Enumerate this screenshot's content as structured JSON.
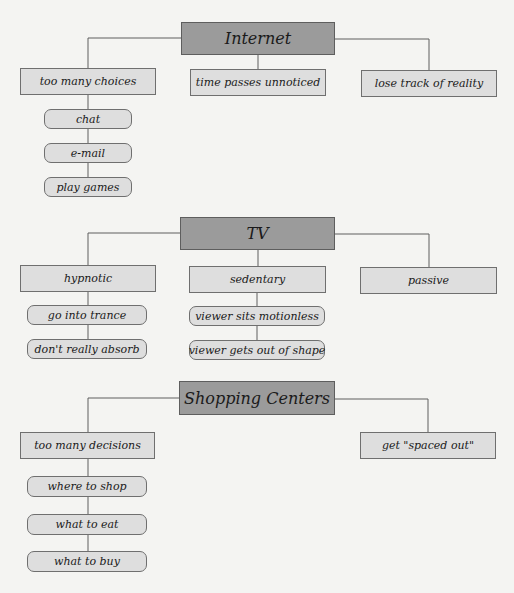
{
  "diagram": {
    "type": "concept-map",
    "colors": {
      "background": "#f4f4f2",
      "head_fill": "#9b9b9b",
      "node_fill": "#dedede",
      "border": "#6f6f6f",
      "line": "#5e5e5e"
    },
    "sections": [
      {
        "title": "Internet",
        "branches": [
          {
            "label": "too many choices",
            "children": [
              "chat",
              "e-mail",
              "play games"
            ]
          },
          {
            "label": "time passes unnoticed",
            "children": []
          },
          {
            "label": "lose track of reality",
            "children": []
          }
        ]
      },
      {
        "title": "TV",
        "branches": [
          {
            "label": "hypnotic",
            "children": [
              "go into trance",
              "don't really absorb"
            ]
          },
          {
            "label": "sedentary",
            "children": [
              "viewer sits motionless",
              "viewer gets out of shape"
            ]
          },
          {
            "label": "passive",
            "children": []
          }
        ]
      },
      {
        "title": "Shopping Centers",
        "branches": [
          {
            "label": "too many decisions",
            "children": [
              "where to shop",
              "what to eat",
              "what to buy"
            ]
          },
          {
            "label": "get \"spaced out\"",
            "children": []
          }
        ]
      }
    ]
  }
}
